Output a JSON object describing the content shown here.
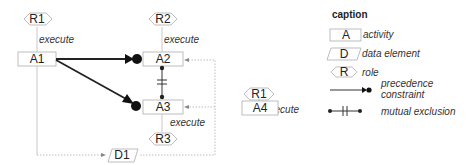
{
  "diagram": {
    "roles": [
      {
        "id": "R1a",
        "label": "R1"
      },
      {
        "id": "R2",
        "label": "R2"
      },
      {
        "id": "R1b",
        "label": "R1"
      },
      {
        "id": "R3",
        "label": "R3"
      }
    ],
    "activities": [
      {
        "id": "A1",
        "label": "A1"
      },
      {
        "id": "A2",
        "label": "A2"
      },
      {
        "id": "A3",
        "label": "A3"
      },
      {
        "id": "A4",
        "label": "A4"
      }
    ],
    "data_elements": [
      {
        "id": "D1",
        "label": "D1"
      }
    ],
    "edge_labels": {
      "r1_a1": "execute",
      "r2_a2": "execute",
      "r1_a4": "execute",
      "a3_r3": "execute"
    },
    "relations": [
      {
        "type": "precedence",
        "from": "A1",
        "to": "A2"
      },
      {
        "type": "precedence",
        "from": "A1",
        "to": "A3"
      },
      {
        "type": "mutual_exclusion",
        "between": [
          "A2",
          "A3"
        ]
      },
      {
        "type": "data_flow",
        "from": "D1",
        "to": [
          "A2",
          "A3"
        ]
      },
      {
        "type": "data_flow",
        "from": "A1",
        "to": "D1"
      }
    ]
  },
  "caption": {
    "title": "caption",
    "items": [
      {
        "symbol": "A",
        "label": "activity"
      },
      {
        "symbol": "D",
        "label": "data element"
      },
      {
        "symbol": "R",
        "label": "role"
      },
      {
        "symbol": "",
        "label": "precedence"
      },
      {
        "symbol": "",
        "label": "constraint"
      },
      {
        "symbol": "",
        "label": "mutual exclusion"
      }
    ]
  }
}
